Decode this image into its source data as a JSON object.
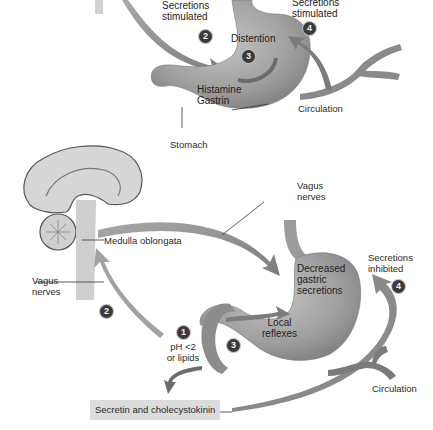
{
  "top_panel": {
    "secretions_stimulated_left": [
      "Secretions",
      "stimulated"
    ],
    "secretions_stimulated_right": [
      "Secretions",
      "stimulated"
    ],
    "distention": "Distention",
    "histamine": "Histamine",
    "gastrin": "Gastrin",
    "circulation": "Circulation",
    "stomach": "Stomach",
    "badges": {
      "left": "2",
      "center": "3",
      "right": "4"
    }
  },
  "bottom_panel": {
    "vagus_nerves_top": [
      "Vagus",
      "nerves"
    ],
    "medulla_oblongata": "Medulla oblongata",
    "vagus_nerves_left": [
      "Vagus",
      "nerves"
    ],
    "decreased_gastric_secretions": [
      "Decreased",
      "gastric",
      "secretions"
    ],
    "secretions_inhibited": [
      "Secretions",
      "inhibited"
    ],
    "local_reflexes": [
      "Local",
      "reflexes"
    ],
    "ph_condition": [
      "pH <2",
      "or lipids"
    ],
    "circulation": "Circulation",
    "secretin_cholecystokinin": "Secretin and cholecystokinin",
    "badges": {
      "one": "1",
      "two": "2",
      "three": "3",
      "four": "4"
    }
  },
  "colors": {
    "organ_fill": "#9a9a9a",
    "arrow_fill": "#8c8c8c",
    "badge_fill": "#3a3a3a",
    "label_box": "#dcdcdc"
  }
}
